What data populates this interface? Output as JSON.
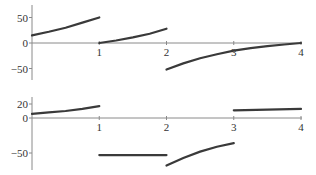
{
  "chart_data": [
    {
      "type": "line",
      "title": "",
      "xlabel": "",
      "ylabel": "",
      "xlim": [
        0,
        4
      ],
      "ylim": [
        -70,
        70
      ],
      "x_ticks": [
        1,
        2,
        3,
        4
      ],
      "x_tick_labels": [
        "1",
        "2",
        "3",
        "4"
      ],
      "y_ticks": [
        50,
        0,
        -50
      ],
      "y_tick_labels": [
        "50",
        "0",
        "−50"
      ],
      "grid": false,
      "legend": null,
      "series": [
        {
          "name": "piece-1",
          "x": [
            0,
            0.25,
            0.5,
            0.75,
            1
          ],
          "y": [
            15,
            22,
            30,
            40,
            50
          ]
        },
        {
          "name": "piece-2",
          "x": [
            1,
            1.25,
            1.5,
            1.75,
            2
          ],
          "y": [
            0,
            5,
            11,
            18,
            28
          ]
        },
        {
          "name": "piece-3",
          "x": [
            2,
            2.25,
            2.5,
            2.75,
            3,
            3.25,
            3.5,
            3.75,
            4
          ],
          "y": [
            -52,
            -40,
            -30,
            -22,
            -15,
            -10,
            -6,
            -3,
            0
          ]
        }
      ]
    },
    {
      "type": "line",
      "title": "",
      "xlabel": "",
      "ylabel": "",
      "xlim": [
        0,
        4
      ],
      "ylim": [
        -75,
        30
      ],
      "x_ticks": [
        1,
        2,
        3,
        4
      ],
      "x_tick_labels": [
        "1",
        "2",
        "3",
        "4"
      ],
      "y_ticks": [
        20,
        0,
        -50
      ],
      "y_tick_labels": [
        "20",
        "0",
        "−50"
      ],
      "grid": false,
      "legend": null,
      "series": [
        {
          "name": "piece-1",
          "x": [
            0,
            0.25,
            0.5,
            0.75,
            1
          ],
          "y": [
            6,
            8,
            10,
            13,
            17
          ]
        },
        {
          "name": "piece-2",
          "x": [
            1,
            2
          ],
          "y": [
            -53,
            -53
          ]
        },
        {
          "name": "piece-3",
          "x": [
            2,
            2.25,
            2.5,
            2.75,
            3
          ],
          "y": [
            -68,
            -57,
            -48,
            -41,
            -36
          ]
        },
        {
          "name": "piece-4",
          "x": [
            3,
            3.5,
            4
          ],
          "y": [
            11,
            12,
            13
          ]
        }
      ]
    }
  ],
  "layout": {
    "x0_px": 32,
    "x_unit_px": 67.25,
    "panels": [
      {
        "zero_y_px": 43,
        "px_per_unit": 0.51,
        "axis_top_px": 5,
        "axis_bottom_px": 80
      },
      {
        "zero_y_px": 118,
        "px_per_unit": 0.7,
        "axis_top_px": 97,
        "axis_bottom_px": 170
      }
    ],
    "curve_color": "#3a3a3a",
    "axis_color": "#8a8a8a"
  }
}
